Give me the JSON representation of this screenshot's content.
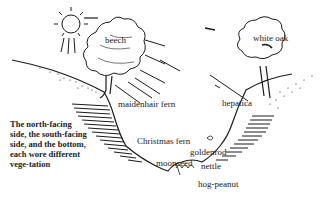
{
  "diagram": {
    "caption": "The north-facing side, the south-facing side, and the bottom, each wore different vegetation",
    "caption_display": "The north-facing side, the south-facing side, and the bottom, each wore different vege-tation",
    "labels": {
      "beech": "beech",
      "white_oak": "white oak",
      "maidenhair_fern": "maidenhair fern",
      "hepatica": "hepatica",
      "christmas_fern": "Christmas fern",
      "goldenrod": "goldenrod",
      "moonseed": "moonseed",
      "nettle": "nettle",
      "hog_peanut": "hog-peanut"
    },
    "elements": [
      "sun",
      "sun-rays",
      "beech-tree",
      "white-oak-tree",
      "ravine-slope-left",
      "ravine-slope-right",
      "ravine-bottom"
    ],
    "colors": {
      "ink": "#1a1a1a",
      "background": "#ffffff"
    }
  }
}
